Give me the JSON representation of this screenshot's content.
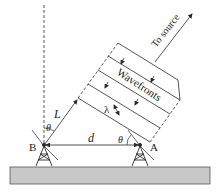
{
  "diagram": {
    "labels": {
      "to_source": "To source",
      "wavefronts": "Wavefronts",
      "baseline_d": "d",
      "path_L": "L",
      "theta_B": "θ",
      "theta_A": "θ",
      "lambda": "λ",
      "antenna_B": "B",
      "antenna_A": "A"
    },
    "colors": {
      "line": "#2a2a2a",
      "ground_fill": "#c8c8c8",
      "ground_stroke": "#555555",
      "background": "#ffffff"
    }
  }
}
